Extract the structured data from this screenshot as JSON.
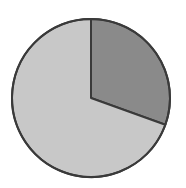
{
  "chart_data": {
    "type": "pie",
    "title": "",
    "slices": [
      {
        "label": "",
        "value": 30.5,
        "color": "#8a8a8a"
      },
      {
        "label": "",
        "value": 69.5,
        "color": "#c8c8c8"
      }
    ],
    "start_angle_deg": 0,
    "direction": "clockwise",
    "outline_color": "#3a3a3a",
    "legend": "none"
  },
  "geometry": {
    "cx": 91,
    "cy": 98,
    "r": 79
  }
}
